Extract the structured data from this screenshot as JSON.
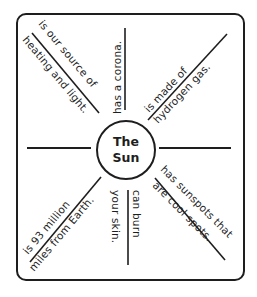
{
  "diagram": {
    "center": {
      "line1": "The",
      "line2": "Sun"
    },
    "facts": [
      {
        "id": "upper-left-diagonal",
        "above": "is our source of",
        "below": "heating and light."
      },
      {
        "id": "top-vertical",
        "text": "has a corona."
      },
      {
        "id": "upper-right-diagonal",
        "above": "is made of",
        "below": "hydrogen gas."
      },
      {
        "id": "lower-right-diagonal",
        "above": "has sunspots that",
        "below": "are cool spots."
      },
      {
        "id": "bottom-vertical",
        "left": "your skin.",
        "right": "can burn"
      },
      {
        "id": "lower-left-diagonal",
        "above": "is 93 million",
        "below": "miles from Earth."
      }
    ],
    "colors": {
      "ink": "#1e1e1e",
      "background": "#ffffff"
    }
  }
}
